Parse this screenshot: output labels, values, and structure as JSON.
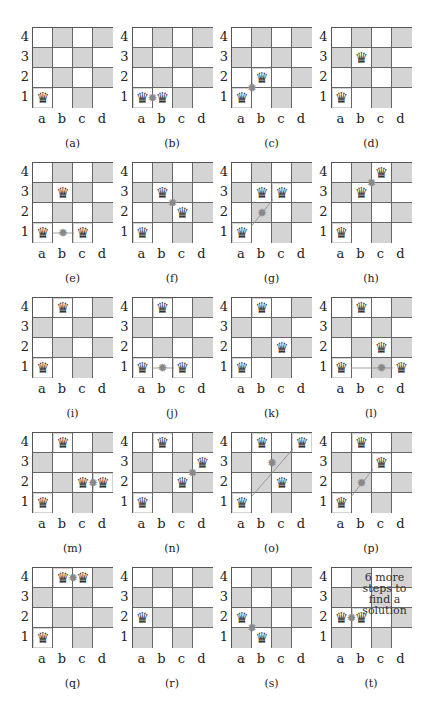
{
  "figure": {
    "files": [
      "a",
      "b",
      "c",
      "d"
    ],
    "ranks": [
      "4",
      "3",
      "2",
      "1"
    ],
    "queen_glyph": "♛",
    "clash_glyph": "✹",
    "colors": {
      "dark_square": "#d4d4d4",
      "light_square": "#ffffff",
      "grid": "#555555",
      "attack_line": "#888888"
    },
    "panels": [
      {
        "label": "(a)",
        "queens": [
          "a1"
        ],
        "clashes": [],
        "lines": []
      },
      {
        "label": "(b)",
        "queens": [
          "a1",
          "b1"
        ],
        "clashes": [
          {
            "between": [
              "a1",
              "b1"
            ]
          }
        ],
        "lines": []
      },
      {
        "label": "(c)",
        "queens": [
          "a1",
          "b2"
        ],
        "clashes": [
          {
            "between": [
              "a1",
              "b2"
            ]
          }
        ],
        "lines": []
      },
      {
        "label": "(d)",
        "queens": [
          "a1",
          "b3"
        ],
        "clashes": [],
        "lines": []
      },
      {
        "label": "(e)",
        "queens": [
          "a1",
          "b3",
          "c1"
        ],
        "clashes": [
          {
            "at": "b1"
          }
        ],
        "lines": [
          [
            "a1",
            "c1"
          ]
        ]
      },
      {
        "label": "(f)",
        "queens": [
          "a1",
          "b3",
          "c2"
        ],
        "clashes": [
          {
            "between": [
              "b3",
              "c2"
            ]
          }
        ],
        "lines": []
      },
      {
        "label": "(g)",
        "queens": [
          "a1",
          "b3",
          "c3"
        ],
        "clashes": [
          {
            "at": "b2"
          }
        ],
        "lines": [
          [
            "a1",
            "c3"
          ]
        ]
      },
      {
        "label": "(h)",
        "queens": [
          "a1",
          "b3",
          "c4"
        ],
        "clashes": [
          {
            "between": [
              "b3",
              "c4"
            ]
          }
        ],
        "lines": []
      },
      {
        "label": "(i)",
        "queens": [
          "a1",
          "b4"
        ],
        "clashes": [],
        "lines": []
      },
      {
        "label": "(j)",
        "queens": [
          "a1",
          "b4",
          "c1"
        ],
        "clashes": [
          {
            "at": "b1"
          }
        ],
        "lines": [
          [
            "a1",
            "c1"
          ]
        ]
      },
      {
        "label": "(k)",
        "queens": [
          "a1",
          "b4",
          "c2"
        ],
        "clashes": [],
        "lines": []
      },
      {
        "label": "(l)",
        "queens": [
          "a1",
          "b4",
          "c2",
          "d1"
        ],
        "clashes": [
          {
            "at": "c1"
          }
        ],
        "lines": [
          [
            "a1",
            "d1"
          ]
        ]
      },
      {
        "label": "(m)",
        "queens": [
          "a1",
          "b4",
          "c2",
          "d2"
        ],
        "clashes": [
          {
            "between": [
              "c2",
              "d2"
            ]
          }
        ],
        "lines": []
      },
      {
        "label": "(n)",
        "queens": [
          "a1",
          "b4",
          "c2",
          "d3"
        ],
        "clashes": [
          {
            "between": [
              "c2",
              "d3"
            ]
          }
        ],
        "lines": []
      },
      {
        "label": "(o)",
        "queens": [
          "a1",
          "b4",
          "c2",
          "d4"
        ],
        "clashes": [
          {
            "at": "b2-c3"
          }
        ],
        "lines": [
          [
            "a1",
            "d4"
          ]
        ]
      },
      {
        "label": "(p)",
        "queens": [
          "a1",
          "b4",
          "c3"
        ],
        "clashes": [
          {
            "at": "b2"
          }
        ],
        "lines": [
          [
            "a1",
            "c3"
          ]
        ]
      },
      {
        "label": "(q)",
        "queens": [
          "a1",
          "b4",
          "c4"
        ],
        "clashes": [
          {
            "between": [
              "b4",
              "c4"
            ]
          }
        ],
        "lines": []
      },
      {
        "label": "(r)",
        "queens": [
          "a2"
        ],
        "clashes": [],
        "lines": []
      },
      {
        "label": "(s)",
        "queens": [
          "a2",
          "b1"
        ],
        "clashes": [
          {
            "between": [
              "a2",
              "b1"
            ]
          }
        ],
        "lines": []
      },
      {
        "label": "(t)",
        "queens": [
          "a2",
          "b2"
        ],
        "clashes": [
          {
            "between": [
              "a2",
              "b2"
            ]
          }
        ],
        "lines": [],
        "note": "6 more steps to find a solution"
      }
    ]
  }
}
